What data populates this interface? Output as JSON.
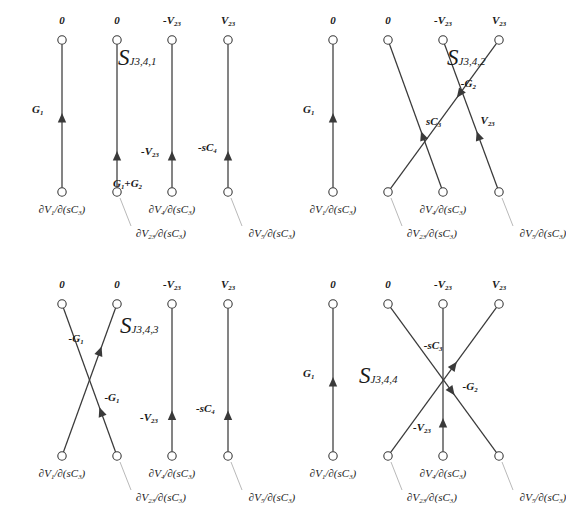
{
  "figure": {
    "type": "signal-flow-graph-grid",
    "background": "#ffffff",
    "line_color": "#3a3a3a",
    "leader_color": "#b9b9b9",
    "node_fill": "#ffffff",
    "rows": 2,
    "cols": 2
  },
  "common": {
    "top_labels": [
      "0",
      "0",
      "-V23",
      "V23"
    ],
    "bottom_labels": [
      "∂V1/∂(sC3)",
      "∂V23/∂(sC3)",
      "∂V4/∂(sC3)",
      "∂V5/∂(sC3)"
    ],
    "bottom_label_parts": [
      {
        "pre": "∂V",
        "sub": "1",
        "post": "/∂(sC",
        "sub2": "3",
        "end": ")"
      },
      {
        "pre": "∂V",
        "sub": "23",
        "post": "/∂(sC",
        "sub2": "3",
        "end": ")"
      },
      {
        "pre": "∂V",
        "sub": "4",
        "post": "/∂(sC",
        "sub2": "3",
        "end": ")"
      },
      {
        "pre": "∂V",
        "sub": "5",
        "post": "/∂(sC",
        "sub2": "3",
        "end": ")"
      }
    ],
    "top_label_parts": [
      {
        "text": "0",
        "sub": ""
      },
      {
        "text": "0",
        "sub": ""
      },
      {
        "text": "-V",
        "sub": "23"
      },
      {
        "text": "V",
        "sub": "23"
      }
    ]
  },
  "panels": [
    {
      "id": "S_J3,4,1",
      "s_main": "S",
      "s_sub": "J3,4,1",
      "position": "top-left",
      "branches": [
        {
          "name": "branch-1-vertical",
          "from": 1,
          "to": 1,
          "label_main": "G",
          "label_sub": "1",
          "direction": "up"
        },
        {
          "name": "branch-2-vertical",
          "from": 2,
          "to": 2,
          "label_main": "G",
          "label_sub": "1",
          "label_extra": "+G",
          "label_extra_sub": "2",
          "direction": "up"
        },
        {
          "name": "branch-3-vertical",
          "from": 3,
          "to": 3,
          "label_main": "-V",
          "label_sub": "23",
          "direction": "up"
        },
        {
          "name": "branch-4-vertical",
          "from": 4,
          "to": 4,
          "label_main": "-sC",
          "label_sub": "4",
          "direction": "up"
        }
      ]
    },
    {
      "id": "S_J3,4,2",
      "s_main": "S",
      "s_sub": "J3,4,2",
      "position": "top-right",
      "branches": [
        {
          "name": "branch-1-vertical",
          "from": 1,
          "to": 1,
          "label_main": "G",
          "label_sub": "1",
          "direction": "up"
        },
        {
          "name": "branch-2-cross-up",
          "from": 3,
          "to": 2,
          "label_main": "sC",
          "label_sub": "3",
          "direction": "up-left"
        },
        {
          "name": "branch-3-cross-down",
          "from": 2,
          "to": 4,
          "label_main": "-G",
          "label_sub": "2",
          "direction": "down-right"
        },
        {
          "name": "branch-4-cross-up",
          "from": 4,
          "to": 3,
          "label_main": "V",
          "label_sub": "23",
          "direction": "up-right"
        }
      ]
    },
    {
      "id": "S_J3,4,3",
      "s_main": "S",
      "s_sub": "J3,4,3",
      "position": "bottom-left",
      "branches": [
        {
          "name": "branch-1-cross-up",
          "from": 1,
          "to": 2,
          "label_main": "-G",
          "label_sub": "1",
          "direction": "up-right"
        },
        {
          "name": "branch-2-cross-up",
          "from": 2,
          "to": 1,
          "label_main": "-G",
          "label_sub": "1",
          "direction": "up-left"
        },
        {
          "name": "branch-3-vertical",
          "from": 3,
          "to": 3,
          "label_main": "-V",
          "label_sub": "23",
          "direction": "up"
        },
        {
          "name": "branch-4-vertical",
          "from": 4,
          "to": 4,
          "label_main": "-sC",
          "label_sub": "4",
          "direction": "up"
        }
      ]
    },
    {
      "id": "S_J3,4,4",
      "s_main": "S",
      "s_sub": "J3,4,4",
      "position": "bottom-right",
      "branches": [
        {
          "name": "branch-1-vertical",
          "from": 1,
          "to": 1,
          "label_main": "G",
          "label_sub": "1",
          "direction": "up"
        },
        {
          "name": "branch-2-cross-up",
          "from": 2,
          "to": 4,
          "label_main": "-sC",
          "label_sub": "3",
          "direction": "up-right"
        },
        {
          "name": "branch-3-vertical",
          "from": 3,
          "to": 3,
          "label_main": "-V",
          "label_sub": "23",
          "direction": "up"
        },
        {
          "name": "branch-4-cross-down",
          "from": 4,
          "to": 2,
          "label_main": "-G",
          "label_sub": "2",
          "direction": "down-left"
        }
      ]
    }
  ]
}
